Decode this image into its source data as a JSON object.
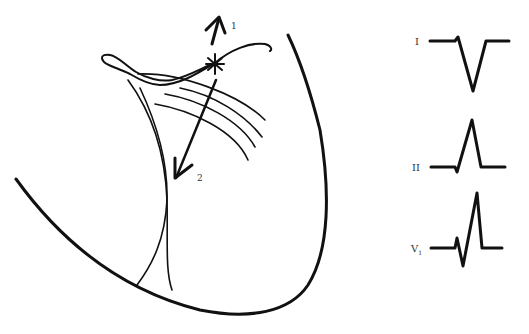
{
  "diagram": {
    "type": "cardiac conduction schematic with ECG leads",
    "vectors": [
      {
        "id": "1",
        "label": "1",
        "direction": "up"
      },
      {
        "id": "2",
        "label": "2",
        "direction": "down-left"
      }
    ],
    "origin_marker": "star / ectopic focus",
    "leads": [
      {
        "name": "I",
        "morphology": "small r, deep negative QS deflection"
      },
      {
        "name": "II",
        "morphology": "small q, tall positive R"
      },
      {
        "name": "V₁",
        "label_main": "V",
        "label_sub": "1",
        "morphology": "rSR' - small r, S, tall R'"
      }
    ]
  },
  "labels": {
    "arrow1": "1",
    "arrow2": "2",
    "lead1": "I",
    "lead2": "II",
    "lead3_main": "V",
    "lead3_sub": "1"
  },
  "colors": {
    "line": "#111111",
    "background": "#ffffff",
    "text": "#333333"
  }
}
